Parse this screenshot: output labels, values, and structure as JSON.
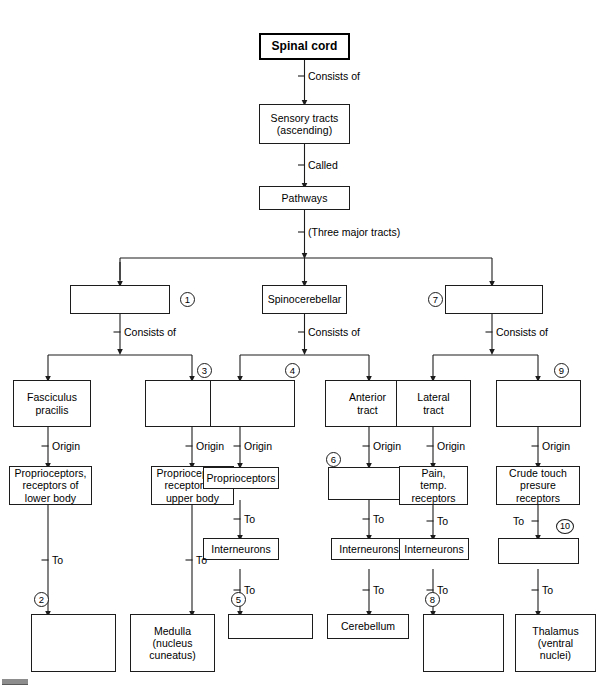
{
  "diagram": {
    "type": "flowchart",
    "line_color": "#1c1c1c",
    "background": "#ffffff"
  },
  "nodes": {
    "root": "Spinal cord",
    "sensory_tracts": "Sensory tracts\n(ascending)",
    "pathways": "Pathways",
    "tract_left": "",
    "tract_middle": "Spinocerebellar",
    "tract_right": "",
    "col1_l2": "Fasciculus\npracilis",
    "col2_l2": "",
    "col3_l2": "",
    "col4_l2": "Anterior\ntract",
    "col5_l2": "Lateral\ntract",
    "col6_l2": "",
    "col1_l3": "Proprioceptors,\nreceptors of\nlower body",
    "col2_l3": "Proprioceptors,\nreceptors of\nupper body",
    "col3_l3": "Proprioceptors",
    "col4_l3": "",
    "col5_l3": "Pain,\ntemp.\nreceptors",
    "col6_l3": "Crude touch\npresure\nreceptors",
    "col3_l4": "Interneurons",
    "col4_l4": "Interneurons",
    "col5_l4": "Interneurons",
    "col6_l4": "",
    "col1_l5": "",
    "col2_l5": "Medulla\n(nucleus\ncuneatus)",
    "col3_l5": "",
    "col4_l5": "Cerebellum",
    "col5_l5": "",
    "col6_l5": "Thalamus\n(ventral\nnuclei)"
  },
  "edge_labels": {
    "consists_of_root": "Consists of",
    "called": "Called",
    "three_major_tracts": "(Three major tracts)",
    "consists_of_left": "Consists of",
    "consists_of_middle": "Consists of",
    "consists_of_right": "Consists of",
    "origin_1": "Origin",
    "origin_2": "Origin",
    "origin_3": "Origin",
    "origin_4": "Origin",
    "origin_5": "Origin",
    "origin_6": "Origin",
    "to_1": "To",
    "to_2": "To",
    "to_3a": "To",
    "to_3b": "To",
    "to_4a": "To",
    "to_4b": "To",
    "to_5a": "To",
    "to_5b": "To",
    "to_6a": "To",
    "to_6b": "To"
  },
  "blank_numbers": {
    "n1": "1",
    "n2": "2",
    "n3": "3",
    "n4": "4",
    "n5": "5",
    "n6": "6",
    "n7": "7",
    "n8": "8",
    "n9": "9",
    "n10": "10"
  }
}
